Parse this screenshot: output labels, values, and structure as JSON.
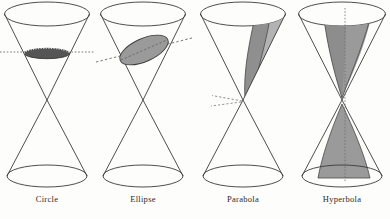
{
  "figure": {
    "background_color": "#fdfdfc",
    "stroke_color": "#3a3a3a",
    "cut_fill_dark": "#555555",
    "cut_fill_gray": "#9a9a9a",
    "cut_fill_light": "#b3b3b3",
    "panels": [
      {
        "id": "circle",
        "label": "Circle",
        "cut_type": "horizontal-plane",
        "description": "Plane parallel to the base cuts the upper nappe forming a circle",
        "plane_orientation_deg": 0,
        "cut_shape": "ellipse-flat",
        "fill": "#555555",
        "guide_line_style": "dotted",
        "center_x": 47
      },
      {
        "id": "ellipse",
        "label": "Ellipse",
        "cut_type": "oblique-plane",
        "description": "Plane tilted but cutting only one nappe forming an ellipse",
        "plane_orientation_deg": -24,
        "cut_shape": "ellipse-tilted",
        "fill": "#9a9a9a",
        "guide_line_style": "dashed",
        "center_x": 143
      },
      {
        "id": "parabola",
        "label": "Parabola",
        "cut_type": "plane-parallel-to-slant",
        "description": "Plane parallel to a generating line cuts one nappe forming a parabola",
        "plane_orientation_deg": -48,
        "cut_shape": "u-region",
        "fill": "#9a9a9a",
        "guide_line_style": "dashed",
        "center_x": 243
      },
      {
        "id": "hyperbola",
        "label": "Hyperbola",
        "cut_type": "vertical-plane",
        "description": "Plane cutting both nappes forming the two branches of a hyperbola",
        "plane_orientation_deg": 90,
        "cut_shape": "two-branches",
        "fill": "#9a9a9a",
        "guide_line_style": "dotted",
        "center_x": 342
      }
    ]
  }
}
